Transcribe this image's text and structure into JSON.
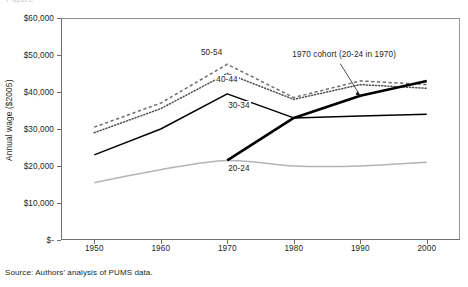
{
  "figure": {
    "title_fragment": "Figure",
    "source_note": "Source: Authors' analysis of PUMS data."
  },
  "chart_data": {
    "type": "line",
    "title": "",
    "subtitle": "",
    "xlabel": "",
    "ylabel": "Annual wage ($2005)",
    "x": [
      1950,
      1960,
      1970,
      1980,
      1990,
      2000
    ],
    "categories": [
      "1950",
      "1960",
      "1970",
      "1980",
      "1990",
      "2000"
    ],
    "xlim": [
      1945,
      2005
    ],
    "ylim": [
      0,
      60000
    ],
    "ytick_values": [
      0,
      10000,
      20000,
      30000,
      40000,
      50000,
      60000
    ],
    "ytick_labels": [
      "$-",
      "$10,000",
      "$20,000",
      "$30,000",
      "$40,000",
      "$50,000",
      "$60,000"
    ],
    "xtick_labels": [
      "1950",
      "1960",
      "1970",
      "1980",
      "1990",
      "2000"
    ],
    "grid": false,
    "legend_position": "inline-labels",
    "series": [
      {
        "name": "50-54",
        "label": "50-54",
        "style": "dashed",
        "color": "#6d6d70",
        "x": [
          1950,
          1960,
          1970,
          1980,
          1990,
          2000
        ],
        "values": [
          30500,
          37000,
          47500,
          38500,
          43000,
          42000
        ]
      },
      {
        "name": "40-44",
        "label": "40-44",
        "style": "dotted",
        "color": "#4f4f52",
        "x": [
          1950,
          1960,
          1970,
          1980,
          1990,
          2000
        ],
        "values": [
          29000,
          35500,
          45000,
          38000,
          42000,
          41000
        ]
      },
      {
        "name": "30-34",
        "label": "30-34",
        "style": "solid",
        "color": "#000000",
        "x": [
          1950,
          1960,
          1970,
          1980,
          1990,
          2000
        ],
        "values": [
          23000,
          30000,
          39500,
          33000,
          33500,
          34000
        ]
      },
      {
        "name": "20-24",
        "label": "20-24",
        "style": "solid",
        "color": "#b4b4b8",
        "x": [
          1950,
          1960,
          1970,
          1980,
          1990,
          2000
        ],
        "values": [
          15500,
          19000,
          21500,
          20000,
          20000,
          21000
        ]
      },
      {
        "name": "1970 cohort",
        "label": "1970 cohort (20-24 in 1970)",
        "style": "solid-thick",
        "color": "#000000",
        "x": [
          1970,
          1980,
          1990,
          2000
        ],
        "values": [
          21500,
          33000,
          39000,
          43000
        ]
      }
    ],
    "annotations": [
      {
        "text": "1970 cohort (20-24 in 1970)",
        "target_x": 1990,
        "target_y": 39000
      }
    ]
  }
}
